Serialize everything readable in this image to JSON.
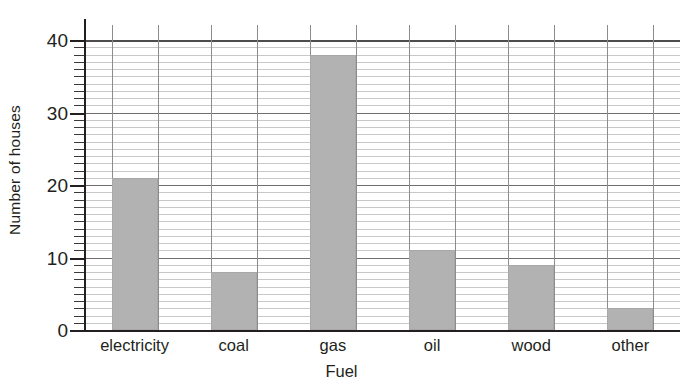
{
  "chart_data": {
    "type": "bar",
    "title": "",
    "subtitle": "",
    "xlabel": "Fuel",
    "ylabel": "Number of houses",
    "categories": [
      "electricity",
      "coal",
      "gas",
      "oil",
      "wood",
      "other"
    ],
    "values": [
      21,
      8,
      38,
      11,
      9,
      3
    ],
    "series": [
      {
        "name": "Number of houses",
        "values": [
          21,
          8,
          38,
          11,
          9,
          3
        ]
      }
    ],
    "ylim": [
      0,
      40
    ],
    "xlim": [
      0,
      6
    ],
    "y_major_ticks": [
      0,
      10,
      20,
      30,
      40
    ],
    "y_major_tick_labels": [
      "0",
      "10",
      "20",
      "30",
      "40"
    ],
    "y_minor_tick_step": 1,
    "grid": {
      "horizontal": true,
      "horizontal_step": 1,
      "vertical": true,
      "vertical_at_bar_edges": true
    },
    "legend": {
      "visible": false,
      "position": "none",
      "entries": []
    },
    "annotations": [],
    "bar_color": "#b2b2b2",
    "bar_edge_color": "#a8a8a8",
    "axis_color": "#231f20",
    "gridline_color": "#c8c8c8",
    "major_gridline_color": "#6e6e6e"
  },
  "axis": {
    "y_title": "Number of houses",
    "x_title": "Fuel"
  }
}
